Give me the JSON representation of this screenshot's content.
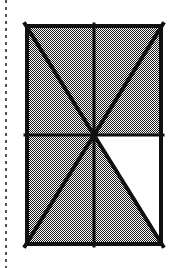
{
  "figure": {
    "name": "shaded-rectangle-eighths",
    "caption": "Rectangle divided into eight triangular sectors by its two diagonals, a vertical midline and a horizontal midline; seven sectors are shaded and one is white.",
    "canvas": {
      "width": 183,
      "height": 268,
      "background_color": "#ffffff"
    },
    "colors": {
      "ink": "#1a1a1a",
      "stroke": "#111111",
      "shade_dark": "#111111",
      "shade_light": "#ffffff",
      "shade_apparent": "#8c8c8c",
      "unshaded": "#ffffff",
      "margin_rule": "#555555"
    },
    "margin_rule": {
      "label": "dashed-margin-line",
      "orientation": "vertical",
      "x": 6,
      "y_start": 0,
      "y_end": 268,
      "dash_on": 3,
      "dash_off": 4,
      "width": 2
    },
    "rectangle": {
      "label": "outer-rectangle",
      "left": 25,
      "top": 24,
      "right": 163,
      "bottom": 246,
      "width": 138,
      "height": 222,
      "border_width": 4,
      "fill": "50-percent-checkerboard-dither"
    },
    "center_point": {
      "label": "center-intersection",
      "x": 94,
      "y": 135
    },
    "midlines": [
      {
        "label": "vertical-midline",
        "x1": 94,
        "y1": 24,
        "x2": 94,
        "y2": 246,
        "width": 3
      },
      {
        "label": "horizontal-midline",
        "x1": 25,
        "y1": 135,
        "x2": 163,
        "y2": 135,
        "width": 3
      }
    ],
    "diagonals": [
      {
        "label": "diagonal-top-left-to-bottom-right",
        "x1": 25,
        "y1": 24,
        "x2": 163,
        "y2": 246,
        "width": 4
      },
      {
        "label": "diagonal-top-right-to-bottom-left",
        "x1": 163,
        "y1": 24,
        "x2": 25,
        "y2": 246,
        "width": 4
      }
    ],
    "sectors": [
      {
        "id": 1,
        "label": "top-left-upper",
        "shaded": true,
        "points": "25,24 94,24 94,135"
      },
      {
        "id": 2,
        "label": "top-left-lower",
        "shaded": true,
        "points": "25,24 94,135 25,135"
      },
      {
        "id": 3,
        "label": "top-right-upper",
        "shaded": true,
        "points": "94,24 163,24 94,135"
      },
      {
        "id": 4,
        "label": "top-right-lower",
        "shaded": true,
        "points": "163,24 163,135 94,135"
      },
      {
        "id": 5,
        "label": "bottom-left-upper",
        "shaded": true,
        "points": "25,135 94,135 25,246"
      },
      {
        "id": 6,
        "label": "bottom-left-lower",
        "shaded": true,
        "points": "25,246 94,135 94,246"
      },
      {
        "id": 7,
        "label": "bottom-right-upper",
        "shaded": false,
        "points": "94,135 163,135 163,246"
      },
      {
        "id": 8,
        "label": "bottom-right-lower",
        "shaded": true,
        "points": "94,135 163,246 94,246"
      }
    ],
    "counts": {
      "total_sectors": 8,
      "shaded_sectors": 7,
      "unshaded_sectors": 1,
      "shaded_fraction": "7/8"
    }
  }
}
